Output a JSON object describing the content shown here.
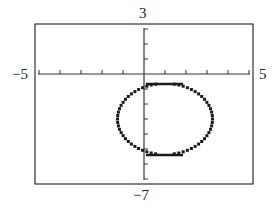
{
  "chart_data": {
    "type": "scatter",
    "title": "",
    "xlabel": "",
    "ylabel": "",
    "xlim": [
      -5,
      5
    ],
    "ylim": [
      -7,
      3
    ],
    "xscale": 1,
    "yscale": 1,
    "grid": false,
    "window_labels": {
      "xmin": "−5",
      "xmax": "5",
      "ymin": "−7",
      "ymax": "3"
    },
    "series": [
      {
        "name": "relation",
        "equation": "(x-1)^2 + (y+3)^2 = 5",
        "center": [
          1,
          -3
        ],
        "radius": 2.236,
        "style": "dotted",
        "extremes": {
          "left": [
            -1.2,
            -3
          ],
          "right": [
            3.2,
            -3
          ],
          "top": [
            1,
            -0.7
          ],
          "bottom": [
            1,
            -5.1
          ]
        }
      }
    ]
  },
  "colors": {
    "frame": "#333333",
    "axes": "#333333",
    "curve": "#1a1a1a",
    "background": "#ffffff"
  }
}
